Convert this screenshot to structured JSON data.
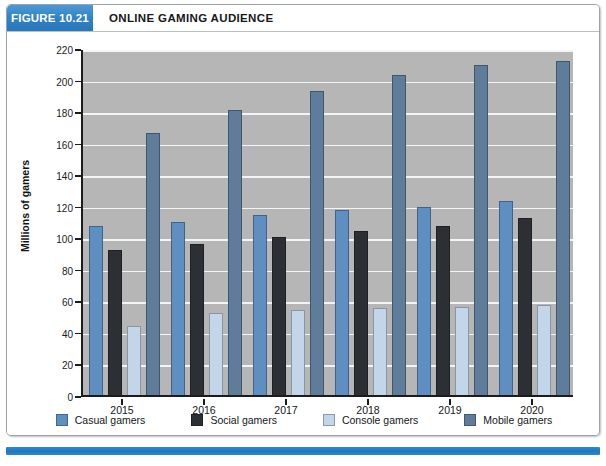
{
  "figure": {
    "tag": "FIGURE 10.21",
    "title": "ONLINE GAMING AUDIENCE"
  },
  "colors": {
    "casual": "#5e8fc0",
    "social": "#2c2f33",
    "console": "#c3d6e9",
    "mobile": "#5f7c9a",
    "plot_background": "#b6b6b6",
    "gridline": "#f2f4f5",
    "accent_blue": "#2f80c4"
  },
  "chart_data": {
    "type": "bar",
    "title": "ONLINE GAMING AUDIENCE",
    "xlabel": "",
    "ylabel": "Millions of gamers",
    "ylim": [
      0,
      220
    ],
    "ytick_step": 20,
    "yticks": [
      0,
      20,
      40,
      60,
      80,
      100,
      120,
      140,
      160,
      180,
      200,
      220
    ],
    "categories": [
      "2015",
      "2016",
      "2017",
      "2018",
      "2019",
      "2020"
    ],
    "grid": true,
    "legend_position": "bottom",
    "series": [
      {
        "name": "Casual gamers",
        "color": "#5e8fc0",
        "values": [
          107,
          110,
          114,
          117,
          119,
          123
        ]
      },
      {
        "name": "Social gamers",
        "color": "#2c2f33",
        "values": [
          92,
          96,
          100,
          104,
          107,
          112
        ]
      },
      {
        "name": "Console gamers",
        "color": "#c3d6e9",
        "values": [
          44,
          52,
          54,
          55,
          56,
          57
        ]
      },
      {
        "name": "Mobile gamers",
        "color": "#5f7c9a",
        "values": [
          166,
          181,
          193,
          203,
          209,
          212
        ]
      }
    ]
  }
}
